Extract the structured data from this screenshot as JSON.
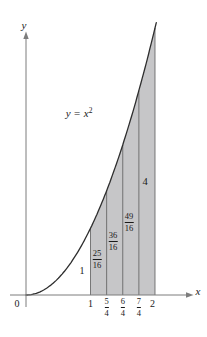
{
  "figure": {
    "background": "#ffffff",
    "shade_color": "#c6c6c8",
    "curve_color": "#2e2e2e",
    "axis_color": "#7d7d7d",
    "line_color": "#5c5c5c",
    "text_color": "#1a1a1a"
  },
  "chart_data": {
    "type": "area",
    "function": "y = x^2",
    "annotation": "y = x^2",
    "xlabel": "x",
    "ylabel": "y",
    "origin_label": "0",
    "curve_domain": [
      0,
      2
    ],
    "shaded_interval": [
      1,
      2
    ],
    "partition_x": [
      1,
      1.25,
      1.5,
      1.75,
      2
    ],
    "x_tick_labels": [
      "1",
      "5/4",
      "6/4",
      "7/4",
      "2"
    ],
    "ordinate_values": [
      1,
      1.5625,
      2.25,
      3.0625,
      4
    ],
    "ordinate_labels": [
      "1",
      "25/16",
      "36/16",
      "49/16",
      "4"
    ],
    "x_range": [
      0,
      2.5
    ],
    "y_range": [
      0,
      4.2
    ],
    "grid": false,
    "legend": false
  },
  "labels": {
    "axis_y": "y",
    "axis_x": "x",
    "origin": "0",
    "eq_lhs": "y",
    "eq_sign": "=",
    "eq_rhs": "x",
    "eq_exp": "2",
    "tick1": "1",
    "tick2": "2",
    "frac54": {
      "n": "5",
      "d": "4"
    },
    "frac64": {
      "n": "6",
      "d": "4"
    },
    "frac74": {
      "n": "7",
      "d": "4"
    },
    "ord1": "1",
    "ord4": "4",
    "frac2516": {
      "n": "25",
      "d": "16"
    },
    "frac3616": {
      "n": "36",
      "d": "16"
    },
    "frac4916": {
      "n": "49",
      "d": "16"
    }
  }
}
